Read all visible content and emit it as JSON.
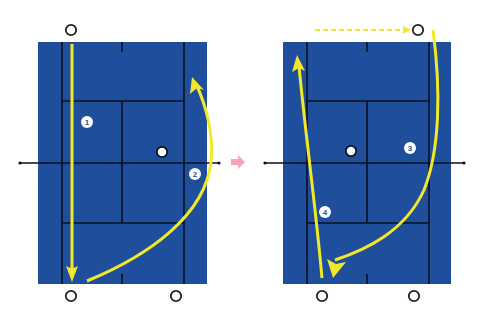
{
  "diagram": {
    "type": "tennis-doubles-tactics",
    "colors": {
      "court": "#1f4e9c",
      "lines": "#0a1020",
      "path": "#f2e82a",
      "transition_arrow": "#f7a6b8",
      "player_marker_stroke": "#222222",
      "ball_fill": "#ffffff",
      "badge_fill": "#ffffff",
      "badge_text": "#1f4e9c"
    },
    "transition_icon": "right-arrow-icon",
    "panels": [
      {
        "id": "left",
        "players": [
          {
            "x": 71,
            "y": 30
          },
          {
            "x": 71,
            "y": 296
          },
          {
            "x": 176,
            "y": 296
          }
        ],
        "ball": {
          "x": 162,
          "y": 152
        },
        "steps": [
          {
            "label": "1",
            "x": 87,
            "y": 122
          },
          {
            "label": "2",
            "x": 195,
            "y": 174
          }
        ]
      },
      {
        "id": "right",
        "players": [
          {
            "x": 418,
            "y": 30
          },
          {
            "x": 322,
            "y": 296
          },
          {
            "x": 414,
            "y": 296
          }
        ],
        "ball": {
          "x": 351,
          "y": 151
        },
        "steps": [
          {
            "label": "3",
            "x": 410,
            "y": 148
          },
          {
            "label": "4",
            "x": 325,
            "y": 212
          }
        ]
      }
    ]
  }
}
